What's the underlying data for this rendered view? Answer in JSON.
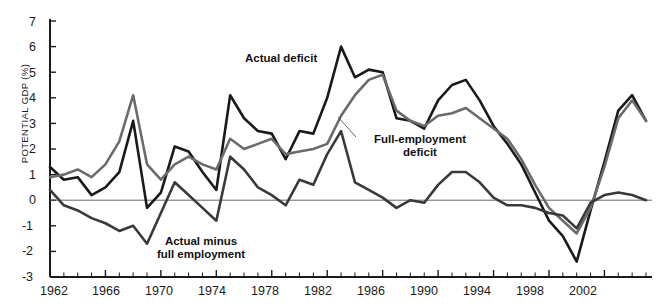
{
  "axes": {
    "ylabel": "POTENTIAL GDP (%)",
    "yticks": [
      "7",
      "6",
      "5",
      "4",
      "3",
      "2",
      "1",
      "0",
      "-1",
      "-2",
      "-3"
    ],
    "xticks": [
      "1962",
      "1966",
      "1970",
      "1974",
      "1978",
      "1982",
      "1986",
      "1990",
      "1994",
      "1998",
      "2002"
    ]
  },
  "annotations": {
    "actual_deficit": "Actual deficit",
    "full_employment_deficit_line1": "Full-employment",
    "full_employment_deficit_line2": "deficit",
    "difference_line1": "Actual minus",
    "difference_line2": "full employment"
  },
  "colors": {
    "actual": "#1a1a1a",
    "full_employment": "#6b6b6b",
    "difference": "#3a3a3a",
    "axis": "#1a1a1a",
    "zeroline": "#555555"
  },
  "chart_data": {
    "type": "line",
    "title": "",
    "xlabel": "",
    "ylabel": "POTENTIAL GDP (%)",
    "xlim": [
      1962,
      2005
    ],
    "ylim": [
      -3,
      7
    ],
    "grid": false,
    "legend": "annotations-inline",
    "x": [
      1962,
      1963,
      1964,
      1965,
      1966,
      1967,
      1968,
      1969,
      1970,
      1971,
      1972,
      1973,
      1974,
      1975,
      1976,
      1977,
      1978,
      1979,
      1980,
      1981,
      1982,
      1983,
      1984,
      1985,
      1986,
      1987,
      1988,
      1989,
      1990,
      1991,
      1992,
      1993,
      1994,
      1995,
      1996,
      1997,
      1998,
      1999,
      2000,
      2001,
      2002,
      2003,
      2004,
      2005
    ],
    "series": [
      {
        "name": "Actual deficit",
        "color": "#1a1a1a",
        "values": [
          1.3,
          0.8,
          0.9,
          0.2,
          0.5,
          1.1,
          3.1,
          -0.3,
          0.3,
          2.1,
          1.9,
          1.1,
          0.4,
          4.1,
          3.2,
          2.7,
          2.6,
          1.6,
          2.7,
          2.6,
          4.0,
          6.0,
          4.8,
          5.1,
          5.0,
          3.2,
          3.1,
          2.8,
          3.9,
          4.5,
          4.7,
          3.9,
          2.9,
          2.2,
          1.4,
          0.3,
          -0.8,
          -1.4,
          -2.4,
          -0.4,
          1.5,
          3.5,
          4.1,
          3.1
        ]
      },
      {
        "name": "Full-employment deficit",
        "color": "#6b6b6b",
        "values": [
          0.9,
          1.0,
          1.2,
          0.9,
          1.4,
          2.3,
          4.1,
          1.4,
          0.8,
          1.4,
          1.7,
          1.4,
          1.2,
          2.4,
          2.0,
          2.2,
          2.4,
          1.8,
          1.9,
          2.0,
          2.2,
          3.3,
          4.1,
          4.7,
          4.9,
          3.5,
          3.1,
          2.9,
          3.3,
          3.4,
          3.6,
          3.2,
          2.8,
          2.4,
          1.6,
          0.6,
          -0.3,
          -0.8,
          -1.3,
          -0.3,
          1.3,
          3.2,
          3.9,
          3.1
        ]
      },
      {
        "name": "Actual minus full employment",
        "color": "#3a3a3a",
        "values": [
          0.4,
          -0.2,
          -0.4,
          -0.7,
          -0.9,
          -1.2,
          -1.0,
          -1.7,
          -0.5,
          0.7,
          0.2,
          -0.3,
          -0.8,
          1.7,
          1.2,
          0.5,
          0.2,
          -0.2,
          0.8,
          0.6,
          1.8,
          2.7,
          0.7,
          0.4,
          0.1,
          -0.3,
          0.0,
          -0.1,
          0.6,
          1.1,
          1.1,
          0.7,
          0.1,
          -0.2,
          -0.2,
          -0.3,
          -0.5,
          -0.6,
          -1.1,
          -0.1,
          0.2,
          0.3,
          0.2,
          0.0
        ]
      }
    ]
  }
}
